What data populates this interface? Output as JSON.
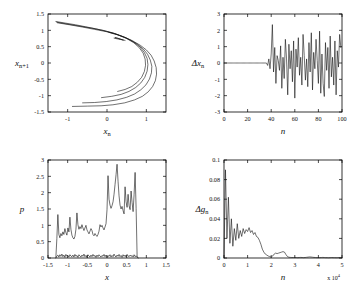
{
  "figure": {
    "background": "#ffffff",
    "line_color": "#111111",
    "panel_count": 4
  },
  "chart_data": [
    {
      "id": "panel-a",
      "type": "line",
      "title": "",
      "xlabel": "x_n",
      "ylabel": "x_n+1",
      "xlabel_glyph": "x",
      "xlabel_sub": "n",
      "ylabel_glyph": "x",
      "ylabel_sub": "n+1",
      "xlim": [
        -1.5,
        1.5
      ],
      "ylim": [
        -1.5,
        1.5
      ],
      "xticks": [
        -1,
        0,
        1
      ],
      "xticklabels": [
        "-1",
        "0",
        "1"
      ],
      "yticks": [
        -1.5,
        -1,
        -0.5,
        0,
        0.5,
        1,
        1.5
      ],
      "yticklabels": [
        "-1.5",
        "-1",
        "-0.5",
        "0",
        "0.5",
        "1",
        "1.5"
      ],
      "grid": false,
      "legend": "none",
      "description": "Henon-type strange attractor, leftward-opening parabolic arcs with several nested strands",
      "series": [
        {
          "name": "outer-branch",
          "points": [
            [
              -1.3,
              1.27
            ],
            [
              -1.05,
              1.22
            ],
            [
              -0.8,
              1.17
            ],
            [
              -0.55,
              1.11
            ],
            [
              -0.3,
              1.05
            ],
            [
              -0.05,
              0.98
            ],
            [
              0.2,
              0.9
            ],
            [
              0.45,
              0.79
            ],
            [
              0.65,
              0.68
            ],
            [
              0.85,
              0.54
            ],
            [
              1.0,
              0.4
            ],
            [
              1.12,
              0.24
            ],
            [
              1.2,
              0.06
            ],
            [
              1.25,
              -0.14
            ],
            [
              1.26,
              -0.34
            ],
            [
              1.23,
              -0.54
            ],
            [
              1.16,
              -0.72
            ],
            [
              1.05,
              -0.88
            ],
            [
              0.9,
              -1.02
            ],
            [
              0.7,
              -1.13
            ],
            [
              0.45,
              -1.22
            ],
            [
              0.15,
              -1.28
            ],
            [
              -0.15,
              -1.31
            ],
            [
              -0.5,
              -1.32
            ],
            [
              -0.88,
              -1.33
            ]
          ]
        },
        {
          "name": "second-branch",
          "points": [
            [
              -1.28,
              1.25
            ],
            [
              -1.0,
              1.19
            ],
            [
              -0.7,
              1.13
            ],
            [
              -0.4,
              1.07
            ],
            [
              -0.1,
              1.0
            ],
            [
              0.18,
              0.91
            ],
            [
              0.42,
              0.8
            ],
            [
              0.6,
              0.7
            ],
            [
              0.78,
              0.57
            ],
            [
              0.92,
              0.43
            ],
            [
              1.03,
              0.27
            ],
            [
              1.1,
              0.09
            ],
            [
              1.14,
              -0.1
            ],
            [
              1.13,
              -0.3
            ],
            [
              1.08,
              -0.49
            ],
            [
              0.99,
              -0.67
            ],
            [
              0.86,
              -0.82
            ],
            [
              0.7,
              -0.95
            ],
            [
              0.5,
              -1.05
            ],
            [
              0.25,
              -1.13
            ],
            [
              -0.02,
              -1.18
            ],
            [
              -0.32,
              -1.21
            ],
            [
              -0.62,
              -1.22
            ]
          ]
        },
        {
          "name": "third-branch",
          "points": [
            [
              -1.26,
              1.23
            ],
            [
              -0.95,
              1.17
            ],
            [
              -0.62,
              1.1
            ],
            [
              -0.32,
              1.03
            ],
            [
              -0.02,
              0.96
            ],
            [
              0.25,
              0.87
            ],
            [
              0.48,
              0.77
            ],
            [
              0.68,
              0.64
            ],
            [
              0.84,
              0.49
            ],
            [
              0.95,
              0.32
            ],
            [
              1.02,
              0.14
            ],
            [
              1.04,
              -0.05
            ],
            [
              1.02,
              -0.25
            ],
            [
              0.96,
              -0.44
            ],
            [
              0.86,
              -0.61
            ],
            [
              0.73,
              -0.75
            ],
            [
              0.56,
              -0.87
            ],
            [
              0.36,
              -0.96
            ],
            [
              0.12,
              -1.02
            ],
            [
              -0.14,
              -1.06
            ]
          ]
        },
        {
          "name": "inner-branch",
          "points": [
            [
              0.05,
              0.94
            ],
            [
              0.28,
              0.86
            ],
            [
              0.5,
              0.75
            ],
            [
              0.68,
              0.62
            ],
            [
              0.82,
              0.47
            ],
            [
              0.92,
              0.3
            ],
            [
              0.97,
              0.12
            ],
            [
              0.98,
              -0.07
            ],
            [
              0.95,
              -0.26
            ],
            [
              0.88,
              -0.44
            ],
            [
              0.77,
              -0.59
            ],
            [
              0.63,
              -0.72
            ],
            [
              0.46,
              -0.81
            ],
            [
              0.27,
              -0.87
            ]
          ]
        },
        {
          "name": "cusp-cluster",
          "points": [
            [
              0.18,
              0.76
            ],
            [
              0.26,
              0.74
            ],
            [
              0.34,
              0.72
            ],
            [
              0.42,
              0.7
            ],
            [
              0.34,
              0.73
            ],
            [
              0.26,
              0.76
            ],
            [
              0.2,
              0.78
            ],
            [
              0.3,
              0.75
            ],
            [
              0.4,
              0.71
            ],
            [
              0.46,
              0.69
            ]
          ]
        }
      ]
    },
    {
      "id": "panel-b",
      "type": "line",
      "title": "",
      "xlabel": "n",
      "ylabel": "delta x_n",
      "ylabel_glyph": "Δx",
      "ylabel_sub": "n",
      "xlim": [
        0,
        100
      ],
      "ylim": [
        -3,
        3
      ],
      "xticks": [
        0,
        20,
        40,
        60,
        80,
        100
      ],
      "xticklabels": [
        "0",
        "20",
        "40",
        "60",
        "80",
        "100"
      ],
      "yticks": [
        -3,
        -2,
        -1,
        0,
        1,
        2,
        3
      ],
      "yticklabels": [
        "-3",
        "-2",
        "-1",
        "0",
        "1",
        "2",
        "3"
      ],
      "grid": false,
      "legend": "none",
      "description": "Synchronization error: identically zero until n about 37, then chaotic bursts between -2.2 and 2.4",
      "series": [
        {
          "name": "delta-x",
          "x_start": 0,
          "x_step": 1,
          "values": [
            0,
            0,
            0,
            0,
            0,
            0,
            0,
            0,
            0,
            0,
            0,
            0,
            0,
            0,
            0,
            0,
            0,
            0,
            0,
            0,
            0,
            0,
            0,
            0,
            0,
            0,
            0,
            0,
            0,
            0,
            0,
            0,
            0,
            0,
            0,
            0,
            0,
            -0.15,
            0.25,
            -0.35,
            0.55,
            2.35,
            -0.55,
            0.95,
            -1.25,
            0.45,
            0.15,
            -0.45,
            1.05,
            -1.55,
            0.35,
            -0.95,
            1.45,
            0.25,
            -1.95,
            1.15,
            -0.35,
            0.75,
            -1.15,
            1.35,
            -2.15,
            0.85,
            -0.25,
            1.55,
            -0.75,
            0.35,
            -1.35,
            1.75,
            0.45,
            -1.05,
            0.25,
            -1.45,
            1.25,
            -0.55,
            1.85,
            -1.65,
            0.65,
            -0.35,
            1.45,
            0.15,
            -1.25,
            1.95,
            -1.85,
            0.55,
            -1.25,
            -2.05,
            1.25,
            -0.45,
            0.95,
            -1.55,
            1.65,
            -0.85,
            0.35,
            -1.35,
            1.35,
            -1.95,
            0.75,
            -0.25,
            1.75,
            0.95
          ]
        }
      ]
    },
    {
      "id": "panel-c",
      "type": "line",
      "title": "",
      "xlabel": "x",
      "ylabel": "p",
      "xlim": [
        -1.5,
        1.5
      ],
      "ylim": [
        0,
        3
      ],
      "xticks": [
        -1.5,
        -1,
        -0.5,
        0,
        0.5,
        1,
        1.5
      ],
      "xticklabels": [
        "-1.5",
        "-1",
        "-0.5",
        "0",
        "0.5",
        "1",
        "1.5"
      ],
      "yticks": [
        0,
        0.5,
        1,
        1.5,
        2,
        2.5,
        3
      ],
      "yticklabels": [
        "0",
        "0.5",
        "1",
        "1.5",
        "2",
        "2.5",
        "3"
      ],
      "grid": false,
      "legend": "none",
      "description": "Invariant density p(x): spiky upper curve rising to 2.85 near x=0.68, plus a noisy near-zero baseline curve",
      "series": [
        {
          "name": "density",
          "x_start": -1.3,
          "x_step": 0.0255,
          "values": [
            0.02,
            0.6,
            1.33,
            0.72,
            0.62,
            0.75,
            0.68,
            0.8,
            0.72,
            0.9,
            0.78,
            0.7,
            0.92,
            0.8,
            1.25,
            0.88,
            0.7,
            0.62,
            0.58,
            0.66,
            0.88,
            1.38,
            1.02,
            0.88,
            0.96,
            0.9,
            1.02,
            0.92,
            0.84,
            0.92,
            1.0,
            0.86,
            0.8,
            0.74,
            0.82,
            0.9,
            0.84,
            0.72,
            0.68,
            0.75,
            0.7,
            0.66,
            0.72,
            0.82,
            1.02,
            0.95,
            1.0,
            0.92,
            0.86,
            0.95,
            1.05,
            1.48,
            2.52,
            1.8,
            1.62,
            1.52,
            1.6,
            1.72,
            1.95,
            2.25,
            2.55,
            2.87,
            2.35,
            1.9,
            1.62,
            1.5,
            1.58,
            1.45,
            1.35,
            2.18,
            1.72,
            1.55,
            1.95,
            1.6,
            1.48,
            2.05,
            1.7,
            1.42,
            1.95,
            2.62,
            1.52,
            0.05,
            0.02
          ]
        },
        {
          "name": "baseline-noise",
          "x_start": -1.3,
          "x_step": 0.0255,
          "values": [
            0.0,
            0.06,
            0.09,
            0.03,
            0.1,
            0.05,
            0.12,
            0.04,
            0.09,
            0.02,
            0.11,
            0.05,
            0.08,
            0.03,
            0.1,
            0.06,
            0.04,
            0.09,
            0.03,
            0.11,
            0.05,
            0.08,
            0.02,
            0.1,
            0.06,
            0.03,
            0.09,
            0.05,
            0.12,
            0.04,
            0.08,
            0.02,
            0.1,
            0.06,
            0.03,
            0.09,
            0.04,
            0.11,
            0.05,
            0.08,
            0.02,
            0.09,
            0.04,
            0.1,
            0.06,
            0.03,
            0.08,
            0.05,
            0.11,
            0.04,
            0.09,
            0.02,
            0.07,
            0.05,
            0.1,
            0.03,
            0.08,
            0.04,
            0.12,
            0.06,
            0.03,
            0.09,
            0.05,
            0.11,
            0.04,
            0.08,
            0.02,
            0.1,
            0.05,
            0.09,
            0.03,
            0.11,
            0.06,
            0.04,
            0.09,
            0.05,
            0.08,
            0.03,
            0.1,
            0.04,
            0.07,
            0.02,
            0.0
          ]
        }
      ]
    },
    {
      "id": "panel-d",
      "type": "line",
      "title": "",
      "xlabel": "n",
      "ylabel": "delta g_n",
      "ylabel_glyph": "Δg",
      "ylabel_sub": "n",
      "xlim": [
        0,
        5
      ],
      "ylim": [
        0,
        0.1
      ],
      "xticks": [
        0,
        1,
        2,
        3,
        4,
        5
      ],
      "xticklabels": [
        "0",
        "1",
        "2",
        "3",
        "4",
        "5"
      ],
      "yticks": [
        0,
        0.02,
        0.04,
        0.06,
        0.08,
        0.1
      ],
      "yticklabels": [
        "0",
        "0.02",
        "0.04",
        "0.06",
        "0.08",
        "0.1"
      ],
      "x_exponent_label": "x 10",
      "x_exponent_power": "4",
      "grid": false,
      "legend": "none",
      "description": "Parameter estimation error decaying from 0.09 toward zero with a small bump near n = 2x10^4",
      "series": [
        {
          "name": "delta-g",
          "x_start": 0.0,
          "x_step": 0.0625,
          "values": [
            0.0,
            0.09,
            0.02,
            0.062,
            0.015,
            0.04,
            0.012,
            0.03,
            0.018,
            0.035,
            0.02,
            0.028,
            0.022,
            0.03,
            0.025,
            0.029,
            0.027,
            0.031,
            0.026,
            0.028,
            0.024,
            0.026,
            0.022,
            0.021,
            0.018,
            0.014,
            0.009,
            0.006,
            0.004,
            0.003,
            0.002,
            0.0015,
            0.001,
            0.002,
            0.004,
            0.005,
            0.0045,
            0.005,
            0.0055,
            0.006,
            0.0065,
            0.006,
            0.0035,
            0.0015,
            0.0008,
            0.0006,
            0.0005,
            0.0005,
            0.0006,
            0.0005,
            0.0004,
            0.0005,
            0.0006,
            0.0005,
            0.0004,
            0.0005,
            0.0007,
            0.0009,
            0.0011,
            0.001,
            0.0008,
            0.0006,
            0.0005,
            0.0004,
            0.0004,
            0.0004,
            0.0005,
            0.0006,
            0.0005,
            0.0004,
            0.0004,
            0.0003,
            0.0004,
            0.0005,
            0.0004,
            0.0004,
            0.0003,
            0.0004,
            0.0004,
            0.0003,
            0.0003
          ]
        }
      ]
    }
  ]
}
